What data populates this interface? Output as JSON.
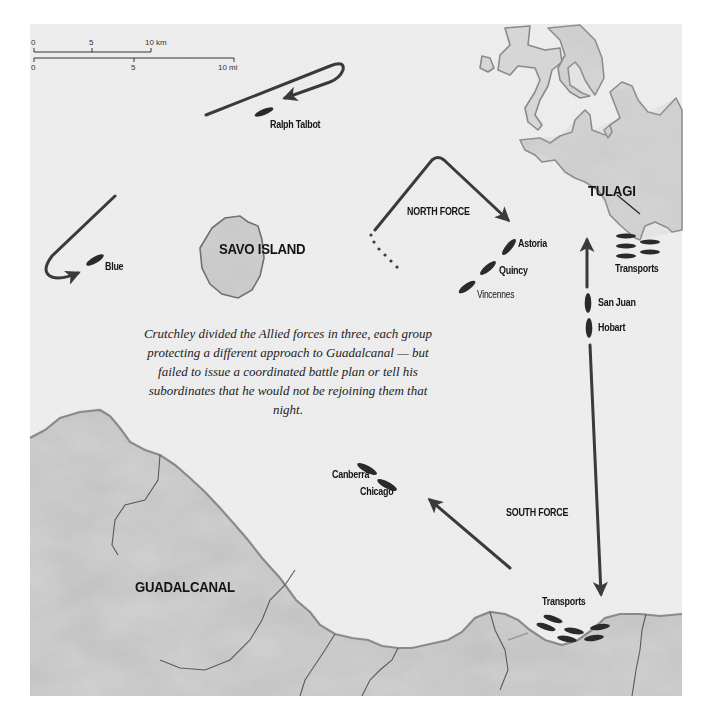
{
  "map": {
    "title_labels": {
      "savo_island": "SAVO ISLAND",
      "tulagi": "TULAGI",
      "guadalcanal": "GUADALCANAL",
      "north_force": "NORTH FORCE",
      "south_force": "SOUTH FORCE"
    },
    "ships": {
      "ralph_talbot": "Ralph Talbot",
      "blue": "Blue",
      "astoria": "Astoria",
      "quincy": "Quincy",
      "vincennes": "Vincennes",
      "san_juan": "San Juan",
      "hobart": "Hobart",
      "canberra": "Canberra",
      "chicago": "Chicago",
      "transports_tulagi": "Transports",
      "transports_guadalcanal": "Transports"
    },
    "scale_bar": {
      "km_ticks": [
        "0",
        "5",
        "10 km"
      ],
      "mi_ticks": [
        "0",
        "5",
        "10 mi"
      ]
    },
    "caption": "Crutchley divided the Allied forces in three, each group protecting a different approach to Guadalcanal — but failed to issue a coordinated battle plan or tell his subordinates that he would not be rejoining them that night.",
    "colors": {
      "sea": "#efefef",
      "land": "#d2d2d2",
      "coast": "#8a8a8a",
      "route": "#3a3a3a",
      "ship": "#2a2a2a",
      "label": "#141414"
    }
  }
}
